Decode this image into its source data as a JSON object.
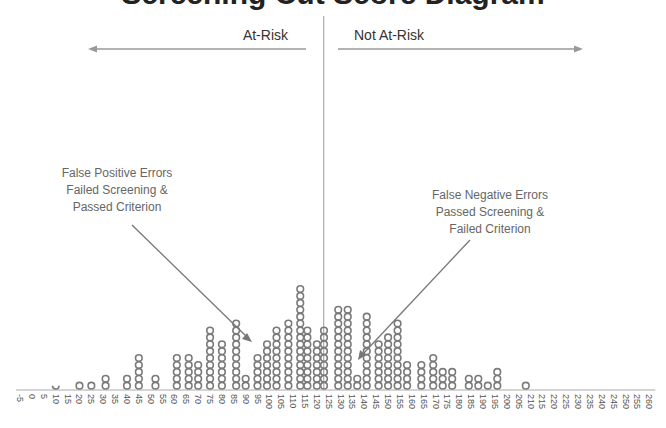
{
  "chart_data": {
    "type": "scatter",
    "subtype": "dot-plot",
    "title": "Screening Cut Score Diagram",
    "title_visible_partially": true,
    "xlabel": "",
    "ylabel": "",
    "xlim": [
      -5,
      260
    ],
    "x_ticks": [
      -5,
      0,
      5,
      10,
      15,
      20,
      25,
      30,
      35,
      40,
      45,
      50,
      55,
      60,
      65,
      70,
      75,
      80,
      85,
      90,
      95,
      100,
      105,
      110,
      115,
      120,
      125,
      130,
      135,
      140,
      145,
      150,
      155,
      160,
      165,
      170,
      175,
      180,
      185,
      190,
      195,
      200,
      205,
      210,
      215,
      220,
      225,
      230,
      235,
      240,
      245,
      250,
      255,
      260
    ],
    "cut_score": 125,
    "grid": false,
    "legend": "none",
    "columns": [
      {
        "x": 10,
        "count": 1,
        "partial": true
      },
      {
        "x": 20,
        "count": 1
      },
      {
        "x": 25,
        "count": 1
      },
      {
        "x": 31,
        "count": 2
      },
      {
        "x": 40,
        "count": 2
      },
      {
        "x": 45,
        "count": 5
      },
      {
        "x": 52,
        "count": 2
      },
      {
        "x": 61,
        "count": 5
      },
      {
        "x": 66,
        "count": 5
      },
      {
        "x": 70,
        "count": 4
      },
      {
        "x": 75,
        "count": 9
      },
      {
        "x": 80,
        "count": 7
      },
      {
        "x": 86,
        "count": 10
      },
      {
        "x": 90,
        "count": 2
      },
      {
        "x": 95,
        "count": 5
      },
      {
        "x": 99,
        "count": 7
      },
      {
        "x": 103,
        "count": 9
      },
      {
        "x": 108,
        "count": 10
      },
      {
        "x": 113,
        "count": 15
      },
      {
        "x": 116,
        "count": 9
      },
      {
        "x": 120,
        "count": 7
      },
      {
        "x": 123,
        "count": 9
      },
      {
        "x": 129,
        "count": 12
      },
      {
        "x": 133,
        "count": 12
      },
      {
        "x": 137,
        "count": 2
      },
      {
        "x": 141,
        "count": 11
      },
      {
        "x": 146,
        "count": 7
      },
      {
        "x": 150,
        "count": 8
      },
      {
        "x": 154,
        "count": 10
      },
      {
        "x": 158,
        "count": 4
      },
      {
        "x": 164,
        "count": 4
      },
      {
        "x": 169,
        "count": 5
      },
      {
        "x": 173,
        "count": 3
      },
      {
        "x": 177,
        "count": 3
      },
      {
        "x": 184,
        "count": 2
      },
      {
        "x": 188,
        "count": 2
      },
      {
        "x": 192,
        "count": 1
      },
      {
        "x": 196,
        "count": 3
      },
      {
        "x": 208,
        "count": 1
      }
    ],
    "regions": {
      "left_label": "At-Risk",
      "right_label": "Not At-Risk"
    },
    "annotations": [
      {
        "id": "false-positive",
        "lines": [
          "False Positive Errors",
          "Failed Screening &",
          "Passed Criterion"
        ],
        "points_to_x": 95
      },
      {
        "id": "false-negative",
        "lines": [
          "False Negative Errors",
          "Passed Screening &",
          "Failed Criterion"
        ],
        "points_to_x": 137
      }
    ]
  }
}
